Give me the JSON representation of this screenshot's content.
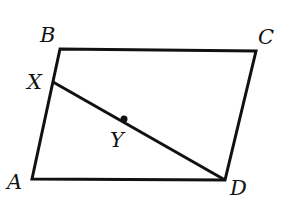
{
  "diagram": {
    "type": "parallelogram",
    "points": {
      "A": {
        "label": "A",
        "x": 32,
        "y": 179
      },
      "B": {
        "label": "B",
        "x": 60,
        "y": 49
      },
      "C": {
        "label": "C",
        "x": 256,
        "y": 51
      },
      "D": {
        "label": "D",
        "x": 225,
        "y": 180
      },
      "X": {
        "label": "X",
        "x": 53,
        "y": 82
      },
      "Y": {
        "label": "Y",
        "x": 124,
        "y": 119
      }
    },
    "segments": [
      "AB",
      "BC",
      "CD",
      "DA",
      "XD"
    ],
    "marked_point": "Y",
    "stroke_color": "#111111"
  }
}
